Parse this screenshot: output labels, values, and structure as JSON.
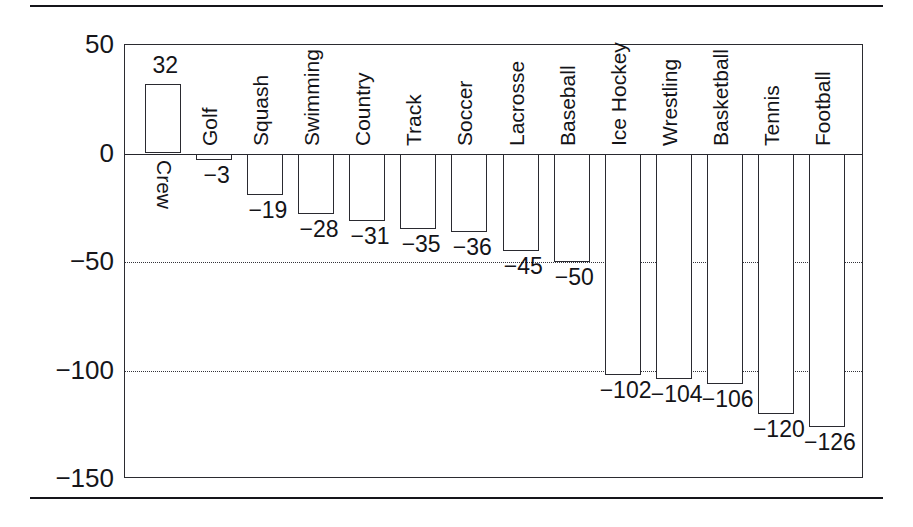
{
  "figure": {
    "has_top_rule": true,
    "has_bottom_rule": true
  },
  "chart_data": {
    "type": "bar",
    "title": "",
    "subtitle": "",
    "xlabel": "",
    "ylabel": "",
    "ylim": [
      -150,
      50
    ],
    "yticks": [
      50,
      0,
      -50,
      -100,
      -150
    ],
    "ytick_labels": [
      "50",
      "0",
      "−50",
      "−100",
      "−150"
    ],
    "grid": "horizontal dotted gridlines at −50 and −100; solid baseline at 0",
    "gridlines_at": [
      -50,
      -100
    ],
    "legend": "none",
    "orientation": "vertical",
    "bar_fill": "#ffffff",
    "bar_edge": "#2a2a30",
    "categories": [
      "Crew",
      "Golf",
      "Squash",
      "Swimming",
      "Country",
      "Track",
      "Soccer",
      "Lacrosse",
      "Baseball",
      "Ice Hockey",
      "Wrestling",
      "Basketball",
      "Tennis",
      "Football"
    ],
    "values": [
      32,
      -3,
      -19,
      -28,
      -31,
      -35,
      -36,
      -45,
      -50,
      -102,
      -104,
      -106,
      -120,
      -126
    ],
    "value_labels": [
      "32",
      "−3",
      "−19",
      "−28",
      "−31",
      "−35",
      "−36",
      "−45",
      "−50",
      "−102",
      "−104",
      "−106",
      "−120",
      "−126"
    ],
    "label_rotation": {
      "Crew": "top-to-bottom (inside plot, below baseline)",
      "others": "bottom-to-top (above baseline)"
    }
  }
}
